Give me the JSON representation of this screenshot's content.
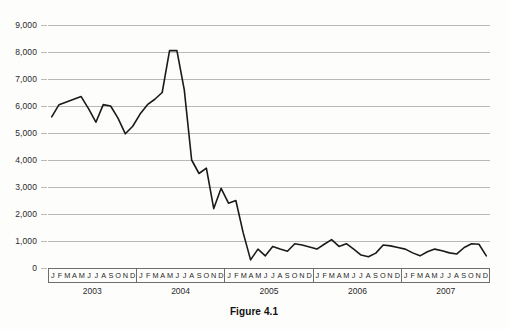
{
  "caption": "Figure 4.1",
  "colors": {
    "line": "#1a1a1a",
    "grid": "#b9b9b9",
    "axis": "#6e6e6e",
    "background": "#fdfdfc",
    "text": "#1f1f1f"
  },
  "axis": {
    "y_ticks": [
      "0",
      "1,000",
      "2,000",
      "3,000",
      "4,000",
      "5,000",
      "6,000",
      "7,000",
      "8,000",
      "9,000"
    ],
    "month_initials": [
      "J",
      "F",
      "M",
      "A",
      "M",
      "J",
      "J",
      "A",
      "S",
      "O",
      "N",
      "D"
    ],
    "years": [
      "2003",
      "2004",
      "2005",
      "2006",
      "2007"
    ]
  },
  "chart_data": {
    "type": "line",
    "title": "",
    "subtitle": "",
    "xlabel": "",
    "ylabel": "",
    "ylim": [
      0,
      9000
    ],
    "ytick_step": 1000,
    "grid": true,
    "legend": null,
    "legend_position": "none",
    "x_tick_labels": [
      "J",
      "F",
      "M",
      "A",
      "M",
      "J",
      "J",
      "A",
      "S",
      "O",
      "N",
      "D",
      "J",
      "F",
      "M",
      "A",
      "M",
      "J",
      "J",
      "A",
      "S",
      "O",
      "N",
      "D",
      "J",
      "F",
      "M",
      "A",
      "M",
      "J",
      "J",
      "A",
      "S",
      "O",
      "N",
      "D",
      "J",
      "F",
      "M",
      "A",
      "M",
      "J",
      "J",
      "A",
      "S",
      "O",
      "N",
      "D",
      "J",
      "F",
      "M",
      "A",
      "M",
      "J",
      "J",
      "A",
      "S",
      "O",
      "N",
      "D"
    ],
    "x": [
      "2003-01",
      "2003-02",
      "2003-03",
      "2003-04",
      "2003-05",
      "2003-06",
      "2003-07",
      "2003-08",
      "2003-09",
      "2003-10",
      "2003-11",
      "2003-12",
      "2004-01",
      "2004-02",
      "2004-03",
      "2004-04",
      "2004-05",
      "2004-06",
      "2004-07",
      "2004-08",
      "2004-09",
      "2004-10",
      "2004-11",
      "2004-12",
      "2005-01",
      "2005-02",
      "2005-03",
      "2005-04",
      "2005-05",
      "2005-06",
      "2005-07",
      "2005-08",
      "2005-09",
      "2005-10",
      "2005-11",
      "2005-12",
      "2006-01",
      "2006-02",
      "2006-03",
      "2006-04",
      "2006-05",
      "2006-06",
      "2006-07",
      "2006-08",
      "2006-09",
      "2006-10",
      "2006-11",
      "2006-12",
      "2007-01",
      "2007-02",
      "2007-03",
      "2007-04",
      "2007-05",
      "2007-06",
      "2007-07",
      "2007-08",
      "2007-09",
      "2007-10",
      "2007-11",
      "2007-12"
    ],
    "values": [
      5600,
      6050,
      6150,
      6250,
      6350,
      5900,
      5400,
      6050,
      6000,
      5550,
      4970,
      5250,
      5700,
      6050,
      6250,
      6500,
      8050,
      8050,
      6600,
      4000,
      3500,
      3700,
      2200,
      2950,
      2400,
      2500,
      1300,
      300,
      700,
      450,
      800,
      700,
      620,
      900,
      850,
      780,
      700,
      880,
      1050,
      800,
      900,
      700,
      480,
      420,
      550,
      850,
      820,
      760,
      700,
      560,
      450,
      600,
      700,
      640,
      560,
      520,
      760,
      900,
      880,
      450
    ]
  }
}
